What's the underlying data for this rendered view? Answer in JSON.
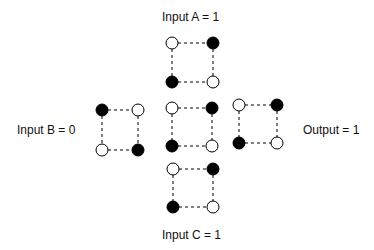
{
  "labels": {
    "input_a": "Input A = 1",
    "input_b": "Input  B = 0",
    "input_c": "Input C = 1",
    "output": "Output = 1"
  },
  "modules": [
    {
      "name": "input-a-cell",
      "x1": 172,
      "y1": 43,
      "x2": 213,
      "y2": 82,
      "states": [
        "open",
        "filled",
        "filled",
        "open"
      ]
    },
    {
      "name": "input-b-cell",
      "x1": 102,
      "y1": 110,
      "x2": 138,
      "y2": 150,
      "states": [
        "filled",
        "open",
        "open",
        "filled"
      ]
    },
    {
      "name": "center-cell",
      "x1": 172,
      "y1": 108,
      "x2": 212,
      "y2": 146,
      "states": [
        "open",
        "filled",
        "filled",
        "open"
      ]
    },
    {
      "name": "output-cell",
      "x1": 239,
      "y1": 105,
      "x2": 277,
      "y2": 143,
      "states": [
        "open",
        "filled",
        "filled",
        "open"
      ]
    },
    {
      "name": "input-c-cell",
      "x1": 173,
      "y1": 169,
      "x2": 213,
      "y2": 207,
      "states": [
        "open",
        "filled",
        "filled",
        "open"
      ]
    }
  ],
  "colors": {
    "ink": "#000000",
    "background": "#ffffff"
  }
}
